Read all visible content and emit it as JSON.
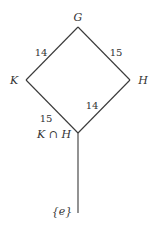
{
  "diagram": {
    "type": "subgroup-lattice",
    "nodes": [
      {
        "id": "G",
        "label": "G",
        "x": 78,
        "y": 27
      },
      {
        "id": "K",
        "label": "K",
        "x": 26,
        "y": 80
      },
      {
        "id": "H",
        "label": "H",
        "x": 130,
        "y": 80
      },
      {
        "id": "KH",
        "label": "K ∩ H",
        "x": 78,
        "y": 133
      },
      {
        "id": "e",
        "label": "{e}",
        "x": 78,
        "y": 213
      }
    ],
    "edges": [
      {
        "from": "G",
        "to": "K",
        "label": "14"
      },
      {
        "from": "G",
        "to": "H",
        "label": "15"
      },
      {
        "from": "K",
        "to": "KH",
        "label": "15"
      },
      {
        "from": "H",
        "to": "KH",
        "label": "14"
      },
      {
        "from": "KH",
        "to": "e",
        "label": ""
      }
    ]
  }
}
